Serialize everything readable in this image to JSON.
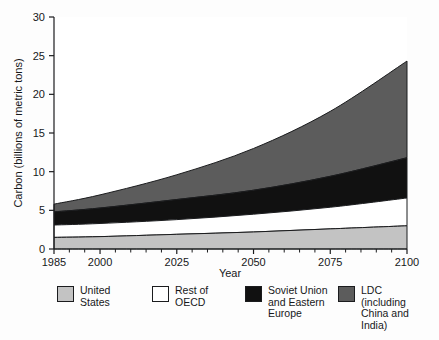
{
  "chart_data": {
    "type": "area",
    "stacked": true,
    "title": "",
    "xlabel": "Year",
    "ylabel": "Carbon (billions of metric tons)",
    "xlim": [
      1985,
      2100
    ],
    "ylim": [
      0,
      30
    ],
    "xticks": [
      1985,
      2000,
      2025,
      2050,
      2075,
      2100
    ],
    "xticklabels": [
      "1985",
      "2000",
      "2025",
      "2050",
      "2075",
      "2100"
    ],
    "yticks": [
      0,
      5,
      10,
      15,
      20,
      25,
      30
    ],
    "yticklabels": [
      "0",
      "5",
      "10",
      "15",
      "20",
      "25",
      "30"
    ],
    "grid": false,
    "legend_position": "below",
    "x": [
      1985,
      2000,
      2025,
      2050,
      2075,
      2100
    ],
    "series": [
      {
        "name": "United States",
        "color": "#c3c3c3",
        "values": [
          1.5,
          1.6,
          1.9,
          2.2,
          2.6,
          3.0
        ]
      },
      {
        "name": "Rest of OECD",
        "color": "#ffffff",
        "values": [
          1.6,
          1.7,
          1.9,
          2.3,
          2.8,
          3.6
        ]
      },
      {
        "name": "Soviet Union and Eastern Europe",
        "color": "#111111",
        "values": [
          1.7,
          2.0,
          2.6,
          3.1,
          4.0,
          5.2
        ]
      },
      {
        "name": "LDC (including China and India)",
        "color": "#5c5c5c",
        "values": [
          1.0,
          1.7,
          3.2,
          5.4,
          8.4,
          12.5
        ]
      }
    ],
    "cumulative_tops": {
      "united_states": [
        1.5,
        1.6,
        1.9,
        2.2,
        2.6,
        3.0
      ],
      "rest_of_oecd": [
        3.1,
        3.3,
        3.8,
        4.5,
        5.4,
        6.6
      ],
      "soviet_union_and_eastern_europe": [
        4.8,
        5.3,
        6.4,
        7.6,
        9.4,
        11.8
      ],
      "ldc": [
        5.8,
        7.0,
        9.6,
        13.0,
        17.8,
        24.3
      ]
    }
  },
  "axes": {
    "y_title": "Carbon (billions of metric tons)",
    "x_title": "Year"
  },
  "legend": {
    "items": [
      {
        "label": "United\nStates",
        "color": "#c3c3c3",
        "swatch_name": "legend-swatch-united-states"
      },
      {
        "label": "Rest of\nOECD",
        "color": "#ffffff",
        "swatch_name": "legend-swatch-rest-of-oecd"
      },
      {
        "label": "Soviet Union\nand Eastern\nEurope",
        "color": "#111111",
        "swatch_name": "legend-swatch-soviet-union"
      },
      {
        "label": "LDC\n(including\nChina and\nIndia)",
        "color": "#5c5c5c",
        "swatch_name": "legend-swatch-ldc"
      }
    ]
  }
}
